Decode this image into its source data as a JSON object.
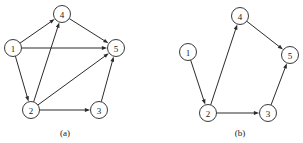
{
  "figure": {
    "width": 303,
    "height": 143,
    "background_color": "#ffffff",
    "stroke_color": "#2b2b2b",
    "node_fill_color": "#ffffff",
    "node_stroke_color": "#3a3a3a",
    "label_color": "#1a1a1a"
  },
  "panels": [
    {
      "id": "panel-a",
      "caption": "(a)",
      "caption_x": 65,
      "caption_y": 133,
      "node_radius": 8.5,
      "nodes": [
        {
          "id": "1",
          "label": "1",
          "cx": 13,
          "cy": 48
        },
        {
          "id": "2",
          "label": "2",
          "cx": 31,
          "cy": 110
        },
        {
          "id": "3",
          "label": "3",
          "cx": 99,
          "cy": 110
        },
        {
          "id": "4",
          "label": "4",
          "cx": 62,
          "cy": 14
        },
        {
          "id": "5",
          "label": "5",
          "cx": 116,
          "cy": 48
        }
      ],
      "edges": [
        {
          "from": "1",
          "to": "4",
          "directed": true
        },
        {
          "from": "1",
          "to": "5",
          "directed": true
        },
        {
          "from": "1",
          "to": "2",
          "directed": true
        },
        {
          "from": "2",
          "to": "4",
          "directed": true
        },
        {
          "from": "2",
          "to": "5",
          "directed": true
        },
        {
          "from": "2",
          "to": "3",
          "directed": true
        },
        {
          "from": "3",
          "to": "5",
          "directed": true
        },
        {
          "from": "4",
          "to": "5",
          "directed": true
        }
      ]
    },
    {
      "id": "panel-b",
      "caption": "(b)",
      "caption_x": 240,
      "caption_y": 133,
      "node_radius": 8.5,
      "nodes": [
        {
          "id": "1",
          "label": "1",
          "cx": 188,
          "cy": 52
        },
        {
          "id": "2",
          "label": "2",
          "cx": 208,
          "cy": 113
        },
        {
          "id": "3",
          "label": "3",
          "cx": 268,
          "cy": 113
        },
        {
          "id": "4",
          "label": "4",
          "cx": 240,
          "cy": 16
        },
        {
          "id": "5",
          "label": "5",
          "cx": 290,
          "cy": 55
        }
      ],
      "edges": [
        {
          "from": "1",
          "to": "2",
          "directed": true
        },
        {
          "from": "2",
          "to": "4",
          "directed": true
        },
        {
          "from": "2",
          "to": "3",
          "directed": true
        },
        {
          "from": "3",
          "to": "5",
          "directed": true
        },
        {
          "from": "4",
          "to": "5",
          "directed": true
        }
      ]
    }
  ]
}
